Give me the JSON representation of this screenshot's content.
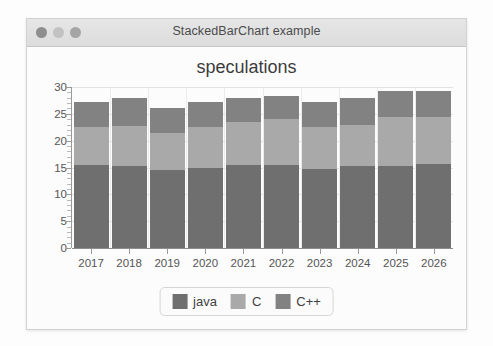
{
  "window": {
    "title": "StackedBarChart example",
    "traffic_lights": [
      {
        "name": "close-button",
        "color": "#8e8e8e"
      },
      {
        "name": "minimize-button",
        "color": "#c2c2c2"
      },
      {
        "name": "maximize-button",
        "color": "#a5a5a5"
      }
    ]
  },
  "chart_data": {
    "type": "bar",
    "stacked": true,
    "title": "speculations",
    "subtitle": "",
    "xlabel": "",
    "ylabel": "",
    "ylim": [
      0,
      30
    ],
    "yticks": [
      0,
      5,
      10,
      15,
      20,
      25,
      30
    ],
    "minor_ticks": true,
    "grid": true,
    "legend_position": "bottom",
    "categories": [
      "2017",
      "2018",
      "2019",
      "2020",
      "2021",
      "2022",
      "2023",
      "2024",
      "2025",
      "2026"
    ],
    "series": [
      {
        "name": "java",
        "color": "#6f6f6f",
        "values": [
          15.5,
          15.3,
          14.5,
          15.0,
          15.5,
          15.5,
          14.8,
          15.2,
          15.3,
          15.7
        ]
      },
      {
        "name": "C",
        "color": "#a9a9a9",
        "values": [
          7.0,
          7.5,
          7.0,
          7.5,
          8.0,
          8.5,
          7.7,
          7.8,
          9.2,
          8.8
        ]
      },
      {
        "name": "C++",
        "color": "#828282",
        "values": [
          4.8,
          5.2,
          4.5,
          4.7,
          4.5,
          4.3,
          4.8,
          5.0,
          4.8,
          4.8
        ]
      }
    ],
    "totals": [
      27.3,
      28.0,
      26.0,
      27.2,
      28.0,
      28.3,
      27.3,
      28.0,
      29.3,
      29.3
    ]
  }
}
